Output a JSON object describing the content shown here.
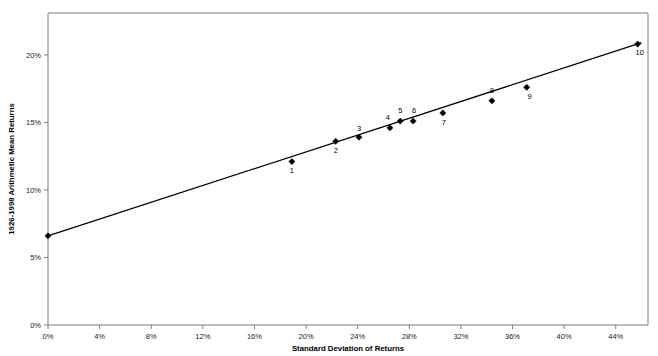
{
  "chart_data": {
    "type": "scatter",
    "title": "",
    "xlabel": "Standard Deviation of Returns",
    "ylabel": "1926-1998 Arithmetic Mean Returns",
    "xlim": [
      0,
      46.5
    ],
    "ylim": [
      0,
      23.1
    ],
    "grid": false,
    "legend": "none",
    "x_tick_labels": [
      "0%",
      "4%",
      "8%",
      "12%",
      "16%",
      "20%",
      "24%",
      "28%",
      "32%",
      "36%",
      "40%",
      "44%"
    ],
    "x_tick_values": [
      0,
      4,
      8,
      12,
      16,
      20,
      24,
      28,
      32,
      36,
      40,
      44
    ],
    "y_tick_labels": [
      "0%",
      "5%",
      "10%",
      "15%",
      "20%"
    ],
    "y_tick_values": [
      0,
      5,
      10,
      15,
      20
    ],
    "point_labels": [
      "1",
      "2",
      "3",
      "4",
      "5",
      "6",
      "7",
      "8",
      "9",
      "10"
    ],
    "x": [
      18.9,
      22.3,
      24.1,
      26.5,
      27.3,
      28.3,
      30.6,
      34.4,
      37.1,
      45.7
    ],
    "y": [
      12.1,
      13.6,
      13.9,
      14.6,
      15.1,
      15.1,
      15.7,
      16.6,
      17.6,
      20.8
    ],
    "label_offsets": [
      {
        "dx": 0,
        "dy": 11
      },
      {
        "dx": 0,
        "dy": 12
      },
      {
        "dx": 0,
        "dy": -6
      },
      {
        "dx": -2,
        "dy": -8
      },
      {
        "dx": 0,
        "dy": -8
      },
      {
        "dx": 1,
        "dy": -8
      },
      {
        "dx": 1,
        "dy": 12
      },
      {
        "dx": 0,
        "dy": -8
      },
      {
        "dx": 3,
        "dy": 12
      },
      {
        "dx": 2,
        "dy": 11
      }
    ],
    "fit_line": {
      "x_start": 0,
      "y_start": 6.6,
      "x_end": 46.0,
      "y_end": 20.9
    },
    "series_name": "Risk vs. Return"
  },
  "colors": {
    "frame": "#7d7d7d",
    "point": "#000000",
    "line": "#000000",
    "text": "#1a1a1a",
    "background": "#ffffff"
  }
}
